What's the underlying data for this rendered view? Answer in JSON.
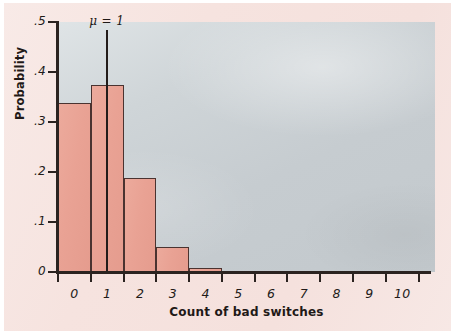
{
  "chart_data": {
    "type": "bar",
    "title": "",
    "subtitle": "",
    "xlabel": "Count of bad switches",
    "ylabel": "Probability",
    "categories": [
      "0",
      "1",
      "2",
      "3",
      "4",
      "5",
      "6",
      "7",
      "8",
      "9",
      "10"
    ],
    "values": [
      0.338,
      0.375,
      0.188,
      0.05,
      0.008,
      0,
      0,
      0,
      0,
      0,
      0
    ],
    "xlim": [
      -0.5,
      11.0
    ],
    "ylim": [
      0,
      0.5
    ],
    "ytick_values": [
      0,
      0.1,
      0.2,
      0.3,
      0.4,
      0.5
    ],
    "ytick_labels": [
      "0",
      ".1",
      ".2",
      ".3",
      ".4",
      ".5"
    ],
    "xtick_values": [
      0,
      1,
      2,
      3,
      4,
      5,
      6,
      7,
      8,
      9,
      10
    ],
    "xtick_labels": [
      "0",
      "1",
      "2",
      "3",
      "4",
      "5",
      "6",
      "7",
      "8",
      "9",
      "10"
    ],
    "grid": false,
    "legend": "none",
    "bar_width": 1.0,
    "annotations": [
      {
        "name": "mean-marker",
        "text": "μ = 1",
        "x": 1,
        "y_from": 0,
        "y_to": 0.485
      }
    ],
    "colors": {
      "bar_fill": "#e9a294",
      "bar_edge": "#4a3330",
      "plot_background": "#c9cfd2",
      "page_background": "#f6e3df",
      "axis": "#2b2320",
      "text": "#1f1917"
    }
  }
}
